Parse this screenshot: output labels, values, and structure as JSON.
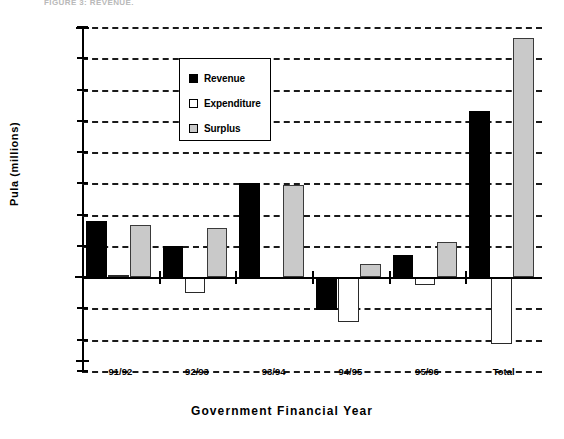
{
  "cutoff_header": "FIGURE 3:  REVENUE,",
  "chart_data": {
    "type": "bar",
    "title": "",
    "xlabel": "Government  Financial  Year",
    "ylabel": "Pula  (millions)",
    "categories": [
      "91/92",
      "92/93",
      "93/94",
      "94/95",
      "95/96",
      "Total"
    ],
    "ylim": [
      -1500,
      4000
    ],
    "ytick_step": 500,
    "yticks": [
      "4000",
      "3500",
      "3000",
      "2500",
      "2000",
      "1500",
      "1000",
      "500",
      "0",
      "-500",
      "-1000",
      "-1500"
    ],
    "grid": true,
    "legend_position": "top-left",
    "series": [
      {
        "name": "Revenue",
        "color": "#000000",
        "values": [
          900,
          500,
          1510,
          -520,
          350,
          2650
        ]
      },
      {
        "name": "Expenditure",
        "color": "#ffffff",
        "values": [
          30,
          -250,
          10,
          -720,
          -130,
          -1070
        ]
      },
      {
        "name": "Surplus",
        "color": "#c9c9c9",
        "values": [
          840,
          790,
          1470,
          215,
          570,
          3830
        ]
      }
    ]
  },
  "legend": {
    "items": [
      {
        "label": "Revenue",
        "swatch": "black-square-icon"
      },
      {
        "label": "Expenditure",
        "swatch": "white-square-icon"
      },
      {
        "label": "Surplus",
        "swatch": "gray-square-icon"
      }
    ]
  }
}
